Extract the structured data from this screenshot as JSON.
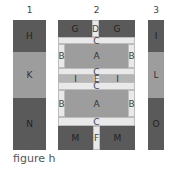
{
  "columns": [
    {
      "number": "1",
      "blocks": [
        "H",
        "K",
        "N"
      ]
    },
    {
      "number": "2",
      "blocks": {
        "top": {
          "left": "G",
          "center": "D",
          "right": "G"
        },
        "sash1": "C",
        "upper": {
          "left": "B",
          "center": "A",
          "right": "B"
        },
        "sash2": "C",
        "middle": {
          "left": "J",
          "center": "E",
          "right": "J"
        },
        "sash3": "C",
        "lower": {
          "left": "B",
          "center": "A",
          "right": "B"
        },
        "sash4": "C",
        "bottom": {
          "left": "M",
          "center": "F",
          "right": "M"
        }
      }
    },
    {
      "number": "3",
      "blocks": [
        "I",
        "L",
        "O"
      ]
    }
  ],
  "caption": "figure h",
  "colors": {
    "dark": "#5a5a5a",
    "medium": "#9d9d9d",
    "light": "#e9e9e9",
    "band": "#b4b4b4"
  }
}
